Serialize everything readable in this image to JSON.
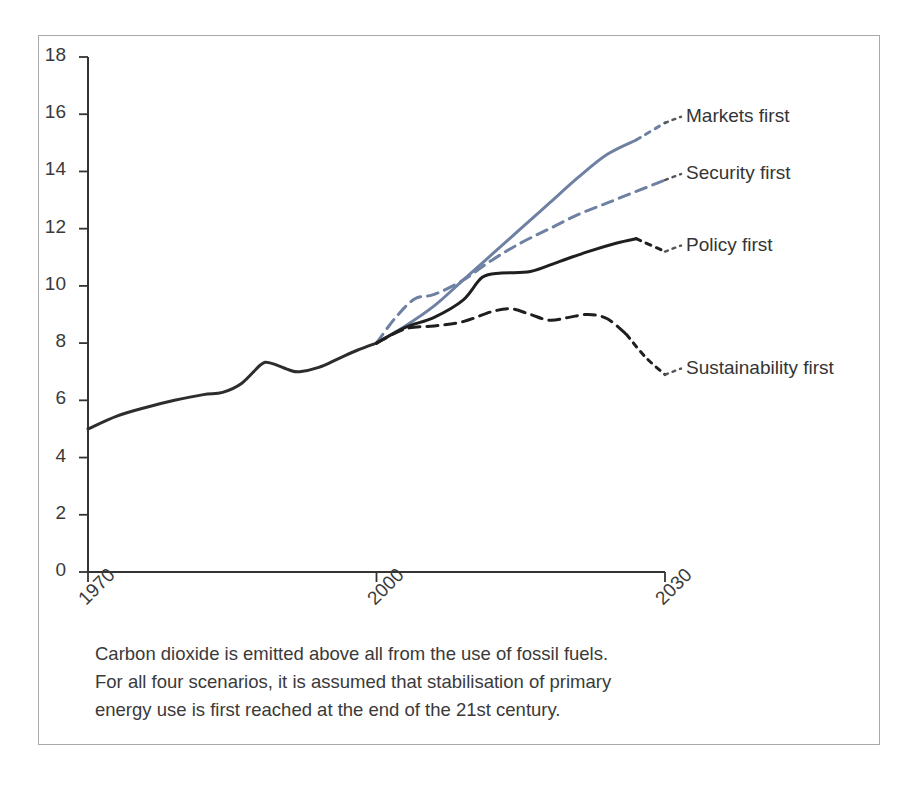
{
  "figure": {
    "frame_color": "#a9a9a9",
    "background": "#ffffff"
  },
  "caption": {
    "line1": "Carbon dioxide is emitted above all from the use of fossil fuels.",
    "line2": "For all four scenarios, it is assumed that stabilisation of primary",
    "line3": "energy use is first reached at the end of the 21st century."
  },
  "chart_data": {
    "type": "line",
    "title": "",
    "subtitle": "",
    "xlabel": "",
    "ylabel": "",
    "xlim": [
      1970,
      2030
    ],
    "ylim": [
      0,
      18
    ],
    "grid": false,
    "legend_position": "right-inline-labels",
    "yticks": [
      0,
      2,
      4,
      6,
      8,
      10,
      12,
      14,
      16,
      18
    ],
    "ytick_labels": [
      "0",
      "2",
      "4",
      "6",
      "8",
      "10",
      "12",
      "14",
      "16",
      "18"
    ],
    "xticks": [
      1970,
      2000,
      2030
    ],
    "xtick_labels": [
      "1970",
      "2000",
      "2030"
    ],
    "colors": {
      "historical": "#2d2d2d",
      "markets_first": "#6e81a2",
      "security_first": "#6e81a2",
      "policy_first": "#1f1f1f",
      "sustainability_first": "#1f1f1f"
    },
    "series": [
      {
        "name": "Historical",
        "label": "",
        "color": "#2d2d2d",
        "style": "solid",
        "x": [
          1970,
          1973,
          1976,
          1979,
          1982,
          1984,
          1986,
          1988,
          1989,
          1991,
          1992,
          1994,
          1996,
          1998,
          2000
        ],
        "values": [
          5.0,
          5.45,
          5.75,
          6.0,
          6.2,
          6.28,
          6.6,
          7.25,
          7.3,
          7.05,
          7.0,
          7.15,
          7.45,
          7.75,
          8.0
        ]
      },
      {
        "name": "Markets first",
        "label": "Markets first",
        "color": "#6e81a2",
        "style": "solid-with-dotted-tail",
        "x": [
          2000,
          2003,
          2006,
          2009,
          2012,
          2015,
          2018,
          2021,
          2024,
          2027,
          2030
        ],
        "values": [
          8.0,
          8.6,
          9.3,
          10.2,
          11.1,
          12.0,
          12.9,
          13.8,
          14.6,
          15.1,
          15.7
        ]
      },
      {
        "name": "Security first",
        "label": "Security first",
        "color": "#6e81a2",
        "style": "dashed",
        "x": [
          2000,
          2002,
          2004,
          2006,
          2009,
          2012,
          2015,
          2018,
          2021,
          2024,
          2027,
          2030
        ],
        "values": [
          8.0,
          8.9,
          9.55,
          9.7,
          10.2,
          10.9,
          11.5,
          12.0,
          12.5,
          12.9,
          13.3,
          13.7
        ]
      },
      {
        "name": "Policy first",
        "label": "Policy first",
        "color": "#1f1f1f",
        "style": "solid-with-dotted-tail",
        "x": [
          2000,
          2003,
          2006,
          2009,
          2011,
          2013,
          2016,
          2019,
          2022,
          2025,
          2027,
          2030
        ],
        "values": [
          8.0,
          8.55,
          8.9,
          9.5,
          10.3,
          10.45,
          10.5,
          10.85,
          11.2,
          11.5,
          11.65,
          11.2
        ]
      },
      {
        "name": "Sustainability first",
        "label": "Sustainability first",
        "color": "#1f1f1f",
        "style": "dashed-with-dotted-tail",
        "x": [
          2000,
          2003,
          2006,
          2009,
          2012,
          2014,
          2016,
          2018,
          2020,
          2022,
          2024,
          2026,
          2028,
          2030
        ],
        "values": [
          8.0,
          8.5,
          8.6,
          8.75,
          9.1,
          9.2,
          9.0,
          8.8,
          8.9,
          9.0,
          8.85,
          8.3,
          7.5,
          6.9
        ]
      }
    ],
    "annotations": [
      {
        "text": "Markets first",
        "x": 2031,
        "y": 15.7
      },
      {
        "text": "Security first",
        "x": 2031,
        "y": 13.7
      },
      {
        "text": "Policy first",
        "x": 2031,
        "y": 11.2
      },
      {
        "text": "Sustainability first",
        "x": 2031,
        "y": 6.9
      }
    ]
  }
}
